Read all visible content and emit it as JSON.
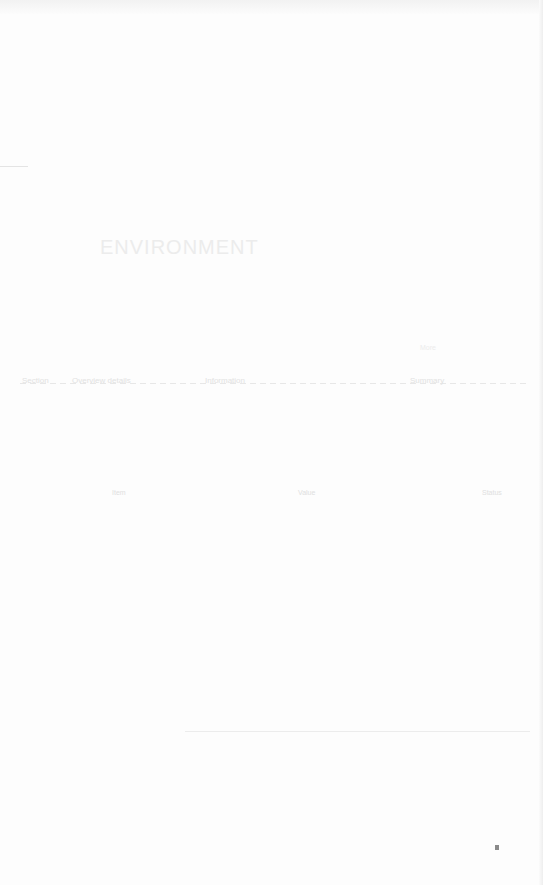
{
  "page": {
    "heading": "ENVIRONMENT",
    "row_items": [
      "Section",
      "Overview details",
      "Information",
      "Summary"
    ],
    "columns": [
      "Item",
      "Value",
      "Status"
    ],
    "side_note": "More"
  }
}
